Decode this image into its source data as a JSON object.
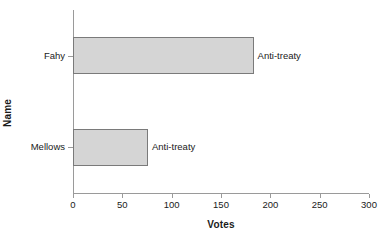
{
  "chart_data": {
    "type": "bar",
    "orientation": "horizontal",
    "title": "",
    "xlabel": "Votes",
    "ylabel": "Name",
    "categories": [
      "Fahy",
      "Mellows"
    ],
    "values": [
      183,
      76
    ],
    "point_labels": [
      "Anti-treaty",
      "Anti-treaty"
    ],
    "xlim": [
      0,
      300
    ],
    "xticks": [
      0,
      50,
      100,
      150,
      200,
      250,
      300
    ],
    "xticklabels": [
      "0",
      "50",
      "100",
      "150",
      "200",
      "250",
      "300"
    ],
    "grid": false,
    "legend": "none",
    "bar_fill_color": "#d5d5d5",
    "bar_edge_color": "#7a7a7a",
    "axis_color": "#9a9a9a",
    "background_color": "#ffffff"
  }
}
